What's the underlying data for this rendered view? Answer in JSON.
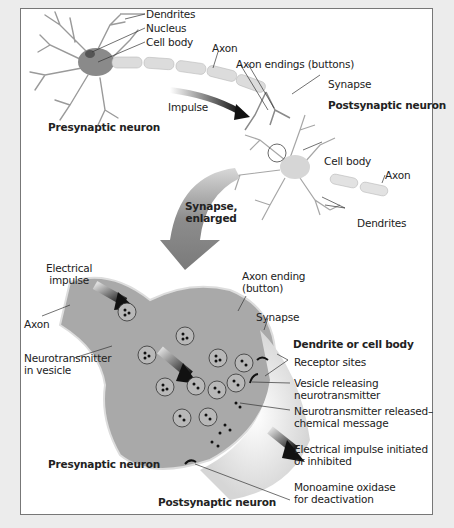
{
  "figure": {
    "top_panel": {
      "labels": {
        "dendrites_top": "Dendrites",
        "nucleus": "Nucleus",
        "cell_body_top": "Cell body",
        "axon_top": "Axon",
        "axon_endings": "Axon endings (buttons)",
        "synapse_top": "Synapse",
        "impulse": "Impulse",
        "postsynaptic_neuron": "Postsynaptic neuron",
        "presynaptic_neuron": "Presynaptic neuron",
        "cell_body_post": "Cell body",
        "axon_post": "Axon",
        "dendrites_post": "Dendrites"
      }
    },
    "transition": {
      "synapse_enlarged_line1": "Synapse,",
      "synapse_enlarged_line2": "enlarged"
    },
    "bottom_panel": {
      "labels": {
        "electrical_impulse_1": "Electrical",
        "electrical_impulse_2": "impulse",
        "axon": "Axon",
        "axon_ending_1": "Axon ending",
        "axon_ending_2": "(button)",
        "synapse": "Synapse",
        "dendrite_or_cell_body": "Dendrite or cell body",
        "receptor_sites": "Receptor sites",
        "neurotransmitter_in_vesicle_1": "Neurotransmitter",
        "neurotransmitter_in_vesicle_2": "in vesicle",
        "vesicle_releasing_1": "Vesicle releasing",
        "vesicle_releasing_2": "neurotransmitter",
        "nt_released_1": "Neurotransmitter released–",
        "nt_released_2": "chemical message",
        "electrical_initiated_1": "Electrical impulse initiated",
        "electrical_initiated_2": "or inhibited",
        "presynaptic_neuron": "Presynaptic neuron",
        "monoamine_1": "Monoamine oxidase",
        "monoamine_2": "for deactivation",
        "postsynaptic_neuron": "Postsynaptic neuron"
      }
    },
    "colors": {
      "background": "#ececec",
      "panel": "#ffffff",
      "neuron_body": "#8a8a8a",
      "dendrite": "#9a9a9a",
      "myelin": "#dcdcdc",
      "arrow": "#7a7a7a",
      "terminal": "#a9a9a9"
    }
  }
}
